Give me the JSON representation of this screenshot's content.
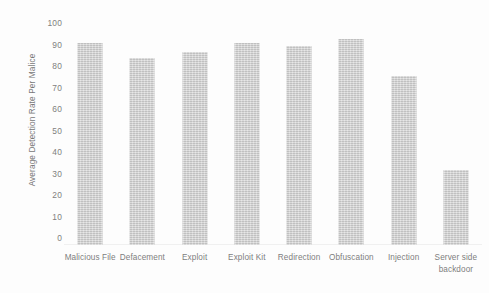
{
  "chart_data": {
    "type": "bar",
    "title": "",
    "xlabel": "",
    "ylabel": "Average Detection Rate Per Malice",
    "ylim": [
      0,
      100
    ],
    "yticks": [
      0,
      10,
      20,
      30,
      40,
      50,
      60,
      70,
      80,
      90,
      100
    ],
    "grid": false,
    "legend": null,
    "bar_color": "#c9c9c9",
    "background_color": "#fdfdfd",
    "categories": [
      "Malicious File",
      "Defacement",
      "Exploit",
      "Exploit Kit",
      "Redirection",
      "Obfuscation",
      "Injection",
      "Server side backdoor"
    ],
    "values": [
      94,
      87,
      90,
      94,
      92.5,
      96,
      78.5,
      35
    ]
  }
}
